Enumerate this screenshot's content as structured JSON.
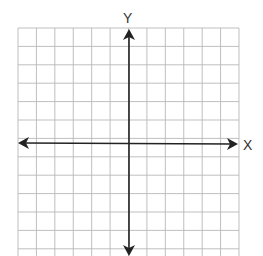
{
  "diagram": {
    "type": "coordinate-plane",
    "x_axis_label": "X",
    "y_axis_label": "Y",
    "grid": {
      "columns": 12,
      "rows": 12,
      "color": "#b8b8b8"
    },
    "axis_color": "#222222"
  }
}
